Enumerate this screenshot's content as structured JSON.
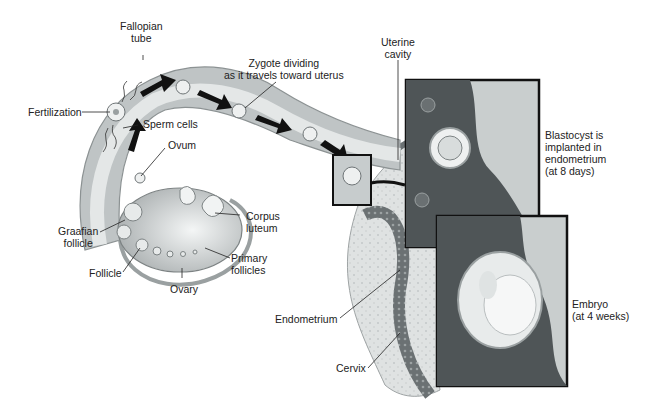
{
  "labels": {
    "fallopian_tube": [
      "Fallopian",
      "tube"
    ],
    "zygote_dividing": [
      "Zygote dividing",
      "as it travels toward uterus"
    ],
    "uterine_cavity": [
      "Uterine",
      "cavity"
    ],
    "fertilization": "Fertilization",
    "sperm_cells": "Sperm cells",
    "ovum": "Ovum",
    "graafian_follicle": [
      "Graafian",
      "follicle"
    ],
    "corpus_luteum": [
      "Corpus",
      "luteum"
    ],
    "follicle": "Follicle",
    "primary_follicles": [
      "Primary",
      "follicles"
    ],
    "ovary": "Ovary",
    "endometrium": "Endometrium",
    "cervix": "Cervix",
    "blastocyst": [
      "Blastocyst is",
      "implanted in",
      "endometrium",
      "(at 8 days)"
    ],
    "embryo": [
      "Embryo",
      "(at 4 weeks)"
    ]
  },
  "colors": {
    "tissue_light": "#d9dcdc",
    "tissue_mid": "#b9bebf",
    "tissue_dark": "#5e6466",
    "outline": "#111111",
    "arrow": "#111111",
    "text": "#222222"
  }
}
